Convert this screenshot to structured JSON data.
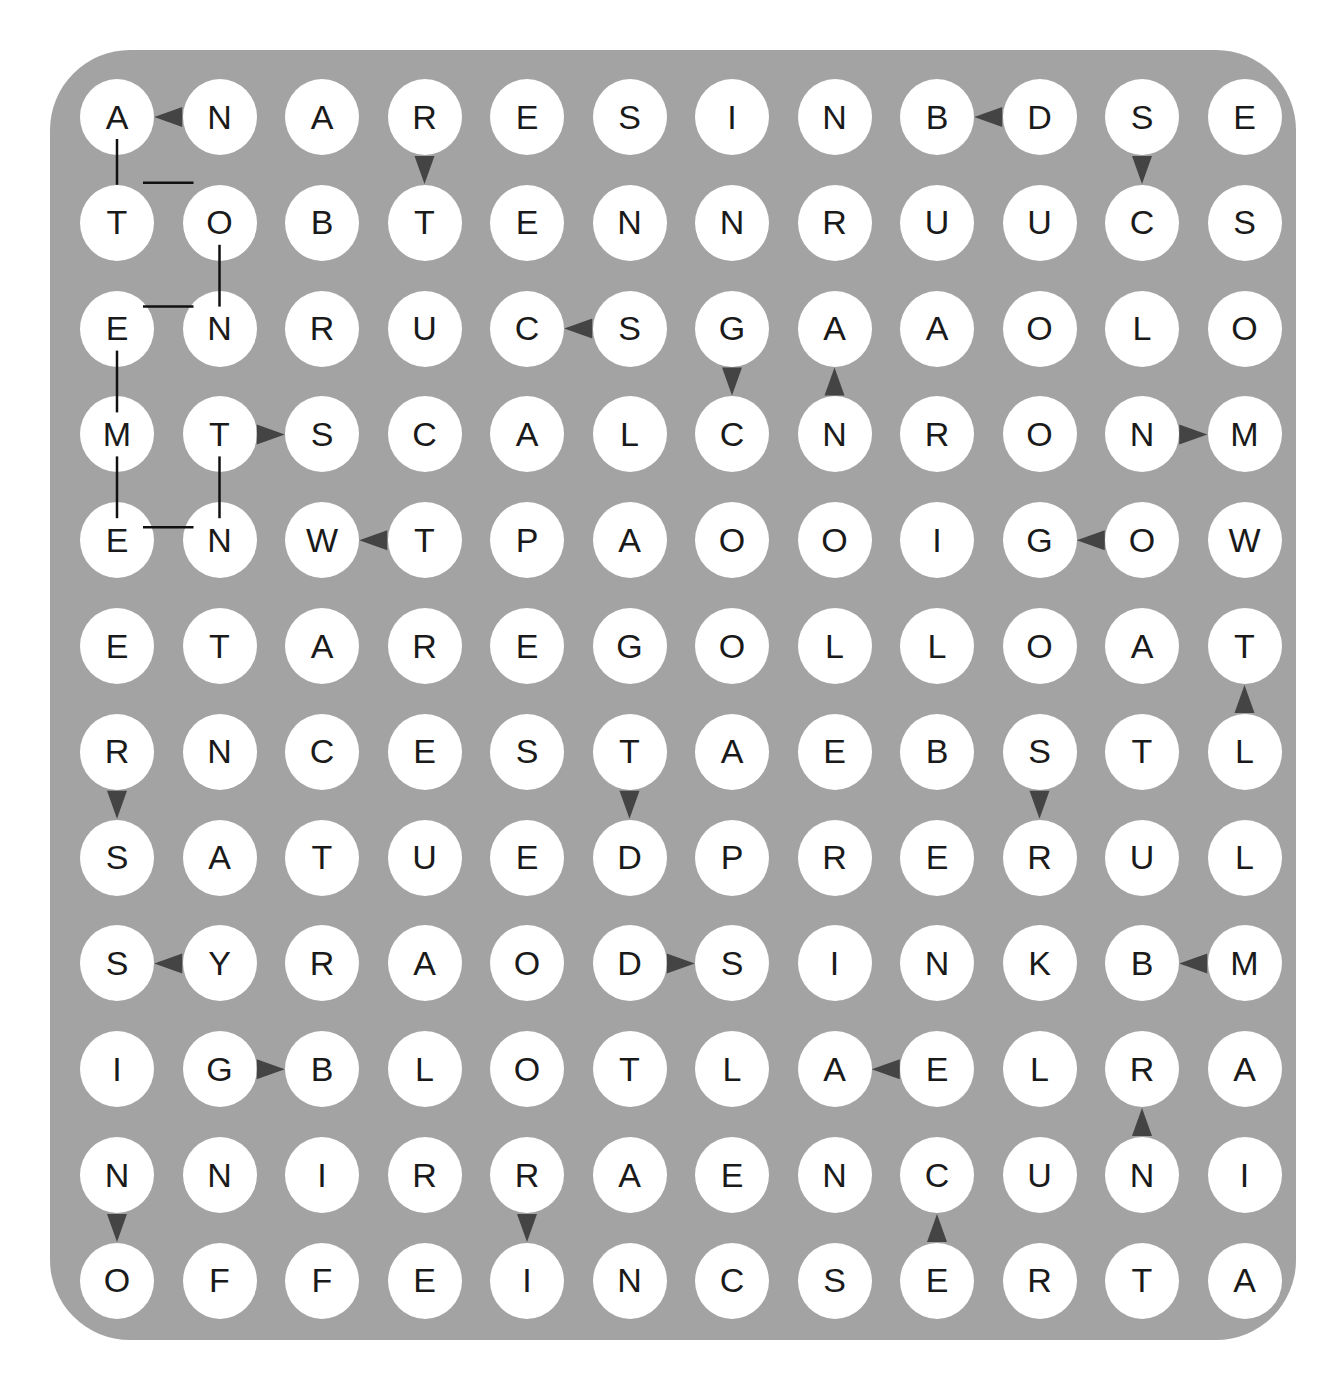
{
  "puzzle": {
    "type": "word-search-maze",
    "rows": 12,
    "cols": 12,
    "grid": [
      [
        "A",
        "N",
        "A",
        "R",
        "E",
        "S",
        "I",
        "N",
        "B",
        "D",
        "S",
        "E"
      ],
      [
        "T",
        "O",
        "B",
        "T",
        "E",
        "N",
        "N",
        "R",
        "U",
        "U",
        "C",
        "S"
      ],
      [
        "E",
        "N",
        "R",
        "U",
        "C",
        "S",
        "G",
        "A",
        "A",
        "O",
        "L",
        "O"
      ],
      [
        "M",
        "T",
        "S",
        "C",
        "A",
        "L",
        "C",
        "N",
        "R",
        "O",
        "N",
        "M"
      ],
      [
        "E",
        "N",
        "W",
        "T",
        "P",
        "A",
        "O",
        "O",
        "I",
        "G",
        "O",
        "W"
      ],
      [
        "E",
        "T",
        "A",
        "R",
        "E",
        "G",
        "O",
        "L",
        "L",
        "O",
        "A",
        "T"
      ],
      [
        "R",
        "N",
        "C",
        "E",
        "S",
        "T",
        "A",
        "E",
        "B",
        "S",
        "T",
        "L"
      ],
      [
        "S",
        "A",
        "T",
        "U",
        "E",
        "D",
        "P",
        "R",
        "E",
        "R",
        "U",
        "L"
      ],
      [
        "S",
        "Y",
        "R",
        "A",
        "O",
        "D",
        "S",
        "I",
        "N",
        "K",
        "B",
        "M"
      ],
      [
        "I",
        "G",
        "B",
        "L",
        "O",
        "T",
        "L",
        "A",
        "E",
        "L",
        "R",
        "A"
      ],
      [
        "N",
        "N",
        "I",
        "R",
        "R",
        "A",
        "E",
        "N",
        "C",
        "U",
        "N",
        "I"
      ],
      [
        "O",
        "F",
        "F",
        "E",
        "I",
        "N",
        "C",
        "S",
        "E",
        "R",
        "T",
        "A"
      ]
    ],
    "arrows": [
      {
        "from": [
          0,
          1
        ],
        "to": [
          0,
          0
        ],
        "dir": "left"
      },
      {
        "from": [
          0,
          3
        ],
        "to": [
          1,
          3
        ],
        "dir": "down"
      },
      {
        "from": [
          0,
          9
        ],
        "to": [
          0,
          8
        ],
        "dir": "left"
      },
      {
        "from": [
          0,
          10
        ],
        "to": [
          1,
          10
        ],
        "dir": "down"
      },
      {
        "from": [
          2,
          5
        ],
        "to": [
          2,
          4
        ],
        "dir": "left"
      },
      {
        "from": [
          2,
          6
        ],
        "to": [
          3,
          6
        ],
        "dir": "down"
      },
      {
        "from": [
          3,
          7
        ],
        "to": [
          2,
          7
        ],
        "dir": "up"
      },
      {
        "from": [
          3,
          1
        ],
        "to": [
          3,
          2
        ],
        "dir": "right"
      },
      {
        "from": [
          3,
          10
        ],
        "to": [
          3,
          11
        ],
        "dir": "right"
      },
      {
        "from": [
          4,
          3
        ],
        "to": [
          4,
          2
        ],
        "dir": "left"
      },
      {
        "from": [
          4,
          10
        ],
        "to": [
          4,
          9
        ],
        "dir": "left"
      },
      {
        "from": [
          6,
          11
        ],
        "to": [
          5,
          11
        ],
        "dir": "up"
      },
      {
        "from": [
          6,
          0
        ],
        "to": [
          7,
          0
        ],
        "dir": "down"
      },
      {
        "from": [
          6,
          5
        ],
        "to": [
          7,
          5
        ],
        "dir": "down"
      },
      {
        "from": [
          6,
          9
        ],
        "to": [
          7,
          9
        ],
        "dir": "down"
      },
      {
        "from": [
          8,
          1
        ],
        "to": [
          8,
          0
        ],
        "dir": "left"
      },
      {
        "from": [
          8,
          5
        ],
        "to": [
          8,
          6
        ],
        "dir": "right"
      },
      {
        "from": [
          8,
          11
        ],
        "to": [
          8,
          10
        ],
        "dir": "left"
      },
      {
        "from": [
          9,
          1
        ],
        "to": [
          9,
          2
        ],
        "dir": "right"
      },
      {
        "from": [
          9,
          8
        ],
        "to": [
          9,
          7
        ],
        "dir": "left"
      },
      {
        "from": [
          10,
          10
        ],
        "to": [
          9,
          10
        ],
        "dir": "up"
      },
      {
        "from": [
          10,
          0
        ],
        "to": [
          11,
          0
        ],
        "dir": "down"
      },
      {
        "from": [
          10,
          4
        ],
        "to": [
          11,
          4
        ],
        "dir": "down"
      },
      {
        "from": [
          11,
          8
        ],
        "to": [
          10,
          8
        ],
        "dir": "up"
      }
    ],
    "solved_path": [
      [
        0,
        0
      ],
      [
        1,
        0
      ],
      [
        1,
        1
      ],
      [
        2,
        1
      ],
      [
        2,
        0
      ],
      [
        3,
        0
      ],
      [
        4,
        0
      ],
      [
        4,
        1
      ],
      [
        3,
        1
      ]
    ],
    "colors": {
      "board": "#a3a3a3",
      "cell": "#ffffff",
      "letter": "#1a1a1a",
      "arrow": "#444444",
      "line": "#111111"
    }
  }
}
